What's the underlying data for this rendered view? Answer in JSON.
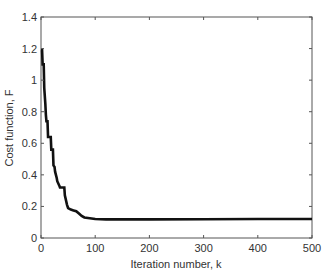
{
  "chart_data": {
    "type": "line",
    "title": "",
    "xlabel": "Iteration number, k",
    "ylabel": "Cost function, F",
    "xlim": [
      0,
      500
    ],
    "ylim": [
      0,
      1.4
    ],
    "xticks": [
      0,
      100,
      200,
      300,
      400,
      500
    ],
    "yticks": [
      0,
      0.2,
      0.4,
      0.6,
      0.8,
      1,
      1.2,
      1.4
    ],
    "xtick_labels": [
      "0",
      "100",
      "200",
      "300",
      "400",
      "500"
    ],
    "ytick_labels": [
      "0",
      "0.2",
      "0.4",
      "0.6",
      "0.8",
      "1",
      "1.2",
      "1.4"
    ],
    "grid": false,
    "legend": null,
    "series": [
      {
        "name": "Cost function",
        "color": "#111111",
        "x": [
          0,
          2,
          3,
          5,
          6,
          8,
          9,
          10,
          12,
          13,
          18,
          19,
          22,
          23,
          25,
          26,
          29,
          30,
          34,
          35,
          43,
          44,
          48,
          50,
          55,
          60,
          65,
          70,
          75,
          80,
          90,
          100,
          120,
          150,
          200,
          300,
          400,
          500
        ],
        "values": [
          1.19,
          1.19,
          1.1,
          1.1,
          0.95,
          0.85,
          0.78,
          0.74,
          0.74,
          0.64,
          0.64,
          0.56,
          0.56,
          0.46,
          0.45,
          0.42,
          0.38,
          0.36,
          0.33,
          0.32,
          0.32,
          0.27,
          0.21,
          0.19,
          0.18,
          0.175,
          0.17,
          0.155,
          0.14,
          0.13,
          0.125,
          0.12,
          0.118,
          0.118,
          0.118,
          0.119,
          0.12,
          0.12
        ]
      }
    ]
  }
}
